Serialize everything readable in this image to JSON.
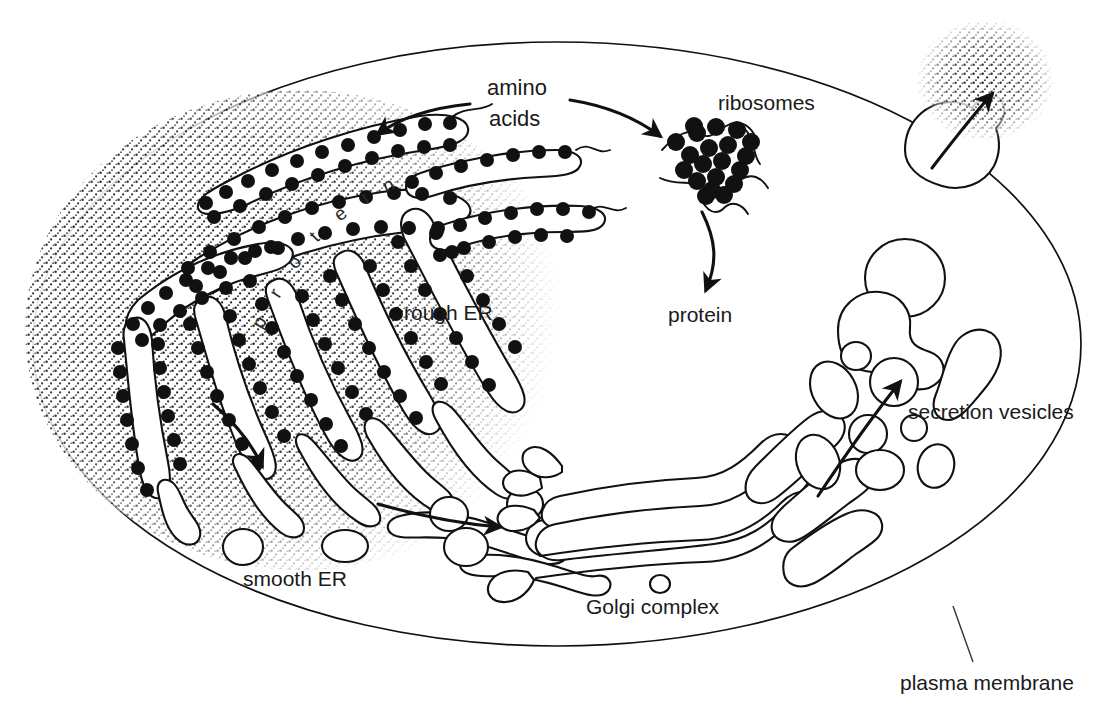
{
  "diagram": {
    "background_color": "#ffffff",
    "ink_color": "#111111"
  },
  "labels": {
    "amino_acids_line1": "amino",
    "amino_acids_line2": "acids",
    "ribosomes": "ribosomes",
    "protein": "protein",
    "rough_er": "rough ER",
    "smooth_er": "smooth ER",
    "golgi": "Golgi complex",
    "secretion_vesicles": "secretion vesicles",
    "plasma_membrane": "plasma membrane",
    "protein_in_lumen": "protein"
  },
  "icons": {
    "arrow_amino_to_rough_er": "arrow-icon",
    "arrow_amino_to_ribosomes": "arrow-icon",
    "arrow_ribosomes_to_protein": "arrow-icon",
    "arrow_rough_to_smooth_er": "arrow-icon",
    "arrow_smooth_er_to_golgi": "arrow-icon",
    "arrow_golgi_to_vesicles": "arrow-icon",
    "arrow_exocytosis": "arrow-icon",
    "leader_plasma_membrane": "leader-line-icon"
  },
  "structures": [
    {
      "name": "plasma-membrane",
      "shape": "ellipse",
      "cx": 557,
      "cy": 344,
      "rx": 524,
      "ry": 302
    },
    {
      "name": "rough-endoplasmic-reticulum",
      "description": "sinuous cisternae studded with black ribosomes in stippled cytoplasm"
    },
    {
      "name": "free-ribosomes",
      "description": "cluster of black dots on wavy mRNA strands"
    },
    {
      "name": "smooth-endoplasmic-reticulum",
      "description": "smooth tubules without ribosomes"
    },
    {
      "name": "transport-vesicles",
      "description": "small empty circles between smooth ER and Golgi"
    },
    {
      "name": "golgi-complex",
      "description": "stack of flattened cisternae with dilated stippled ends"
    },
    {
      "name": "secretion-vesicles",
      "description": "stippled irregular vesicles moving toward membrane"
    },
    {
      "name": "exocytosis-site",
      "description": "vesicle fusing with plasma membrane releasing contents"
    }
  ],
  "label_positions": {
    "amino_acids": {
      "x": 487,
      "y": 95
    },
    "ribosomes": {
      "x": 768,
      "y": 110
    },
    "protein": {
      "x": 700,
      "y": 320
    },
    "rough_er": {
      "x": 457,
      "y": 318
    },
    "smooth_er": {
      "x": 300,
      "y": 582
    },
    "golgi": {
      "x": 655,
      "y": 612
    },
    "secretion_vesicles": {
      "x": 982,
      "y": 417
    },
    "plasma_membrane": {
      "x": 984,
      "y": 683
    }
  }
}
